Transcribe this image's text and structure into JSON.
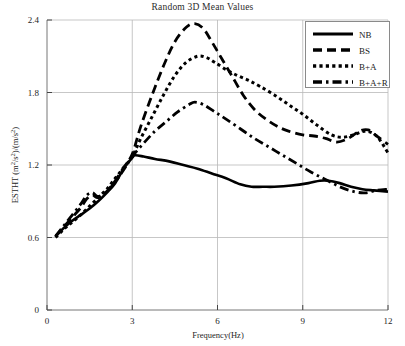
{
  "chart_data": {
    "type": "line",
    "title": "Random 3D Mean Values",
    "xlabel": "Frequency(Hz)",
    "ylabel": "ESTHT (m²/s²)/(m/s²)",
    "ylabel_parts": {
      "prefix": "ESTHT (m",
      "sup1": "2",
      "mid": "/s",
      "sup2": "2",
      "mid2": ")/(m/s",
      "sup3": "2",
      "suffix": ")"
    },
    "xlim": [
      0,
      12
    ],
    "ylim": [
      0,
      2.4
    ],
    "xticks": [
      0,
      3,
      6,
      9,
      12
    ],
    "xtick_labels": [
      "0",
      "3",
      "6",
      "9",
      "12"
    ],
    "yticks": [
      0,
      0.6,
      1.2,
      1.8,
      2.4
    ],
    "ytick_labels": [
      "0",
      "0.6",
      "1.2",
      "1.8",
      "2.4"
    ],
    "grid": true,
    "grid_color": "#b9b9b9",
    "legend_position": "top-right",
    "line_color": "#000000",
    "series": [
      {
        "name": "NB",
        "style": "solid",
        "dasharray": "",
        "width": 2.6,
        "x": [
          0.3,
          0.6,
          0.9,
          1.2,
          1.5,
          1.8,
          2.1,
          2.4,
          2.7,
          3.0,
          3.1,
          3.4,
          3.8,
          4.3,
          4.8,
          5.3,
          5.8,
          6.3,
          6.8,
          7.2,
          7.6,
          8.0,
          8.6,
          9.2,
          9.6,
          9.9,
          10.3,
          10.7,
          11.1,
          11.5,
          12.0
        ],
        "values": [
          0.61,
          0.68,
          0.74,
          0.79,
          0.84,
          0.9,
          0.97,
          1.05,
          1.17,
          1.26,
          1.28,
          1.27,
          1.25,
          1.23,
          1.2,
          1.17,
          1.13,
          1.09,
          1.04,
          1.02,
          1.02,
          1.02,
          1.03,
          1.05,
          1.07,
          1.07,
          1.05,
          1.02,
          1.0,
          0.99,
          0.98
        ]
      },
      {
        "name": "BS",
        "style": "dashed",
        "dasharray": "9,5",
        "width": 2.8,
        "x": [
          0.3,
          0.6,
          0.9,
          1.2,
          1.4,
          1.6,
          1.8,
          2.1,
          2.4,
          2.7,
          3.0,
          3.3,
          3.7,
          4.1,
          4.5,
          4.9,
          5.2,
          5.5,
          5.8,
          6.1,
          6.5,
          6.9,
          7.3,
          7.7,
          8.1,
          8.5,
          9.0,
          9.4,
          9.8,
          10.2,
          10.6,
          11.0,
          11.3,
          11.6,
          12.0
        ],
        "values": [
          0.61,
          0.69,
          0.77,
          0.85,
          0.92,
          0.95,
          0.93,
          0.98,
          1.07,
          1.18,
          1.29,
          1.52,
          1.78,
          2.02,
          2.22,
          2.34,
          2.37,
          2.33,
          2.22,
          2.1,
          1.94,
          1.78,
          1.66,
          1.58,
          1.52,
          1.48,
          1.45,
          1.44,
          1.42,
          1.39,
          1.42,
          1.48,
          1.49,
          1.44,
          1.37
        ]
      },
      {
        "name": "B+A",
        "style": "dotted",
        "dasharray": "3.2,3.2",
        "width": 3.0,
        "x": [
          0.3,
          0.6,
          0.9,
          1.2,
          1.5,
          1.8,
          2.1,
          2.4,
          2.7,
          3.0,
          3.3,
          3.7,
          4.1,
          4.5,
          4.9,
          5.3,
          5.6,
          5.9,
          6.3,
          6.7,
          7.1,
          7.5,
          8.0,
          8.5,
          9.0,
          9.5,
          10.0,
          10.4,
          10.8,
          11.2,
          11.6,
          12.0
        ],
        "values": [
          0.6,
          0.67,
          0.73,
          0.79,
          0.86,
          0.93,
          1.0,
          1.09,
          1.18,
          1.27,
          1.42,
          1.6,
          1.78,
          1.94,
          2.05,
          2.1,
          2.09,
          2.05,
          1.99,
          1.94,
          1.9,
          1.85,
          1.78,
          1.7,
          1.62,
          1.53,
          1.45,
          1.43,
          1.45,
          1.48,
          1.44,
          1.3
        ]
      },
      {
        "name": "B+A+R",
        "style": "dashdot",
        "dasharray": "9,4,2.5,4",
        "width": 2.8,
        "x": [
          0.3,
          0.6,
          0.9,
          1.2,
          1.4,
          1.6,
          1.8,
          2.1,
          2.4,
          2.7,
          3.0,
          3.4,
          3.8,
          4.2,
          4.6,
          5.0,
          5.2,
          5.5,
          5.9,
          6.3,
          6.8,
          7.3,
          7.8,
          8.3,
          8.8,
          9.3,
          9.8,
          10.3,
          10.8,
          11.2,
          11.6,
          12.0
        ],
        "values": [
          0.61,
          0.7,
          0.79,
          0.88,
          0.95,
          0.97,
          0.94,
          0.98,
          1.06,
          1.16,
          1.27,
          1.38,
          1.48,
          1.56,
          1.64,
          1.7,
          1.72,
          1.7,
          1.64,
          1.58,
          1.5,
          1.42,
          1.35,
          1.28,
          1.21,
          1.14,
          1.08,
          1.02,
          0.98,
          0.97,
          0.99,
          1.0
        ]
      }
    ]
  },
  "legend": {
    "items": [
      {
        "label": "NB"
      },
      {
        "label": "BS"
      },
      {
        "label": "B+A"
      },
      {
        "label": "B+A+R"
      }
    ]
  }
}
